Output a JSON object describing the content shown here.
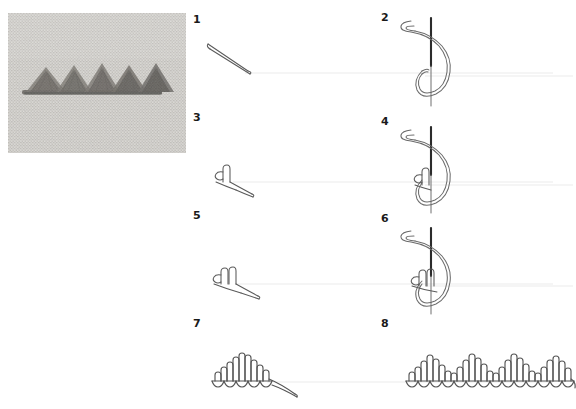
{
  "document": {
    "type": "embroidery-stitch-tutorial",
    "title": "",
    "background_color": "#ffffff",
    "step_count": 8
  },
  "photo": {
    "name": "finished-stitch-photograph",
    "description": "Photograph of linen fabric embroidered with five dark triangular peaked stitch motifs along a horizontal baseline",
    "fabric_color": "#cfcdc8",
    "thread_color": "#4a4742",
    "peak_count": 5,
    "frame": {
      "x": 8,
      "y": 13,
      "width": 178,
      "height": 140
    }
  },
  "guideline": {
    "name": "baseline-guide",
    "color": "#f2f2f2"
  },
  "ink": {
    "outline": "#5a5a5a",
    "needle": "#2b2b2b",
    "thread": "#6b6b6b"
  },
  "steps": [
    {
      "number": "1",
      "name": "step-1-first-diagonal-thread",
      "column": "left",
      "row": 1,
      "caption": "",
      "figure": "diagonal-thread-stroke"
    },
    {
      "number": "2",
      "name": "step-2-needle-wrapped-loop",
      "column": "right",
      "row": 1,
      "caption": "",
      "figure": "needle-with-thread-loop"
    },
    {
      "number": "3",
      "name": "step-3-single-knot-formed",
      "column": "left",
      "row": 2,
      "caption": "",
      "figure": "single-knot-with-tail"
    },
    {
      "number": "4",
      "name": "step-4-needle-loop-over-one-knot",
      "column": "right",
      "row": 2,
      "caption": "",
      "figure": "needle-loop-with-one-knot"
    },
    {
      "number": "5",
      "name": "step-5-two-knots-formed",
      "column": "left",
      "row": 3,
      "caption": "",
      "figure": "two-knots-with-tail"
    },
    {
      "number": "6",
      "name": "step-6-needle-loop-over-two-knots",
      "column": "right",
      "row": 3,
      "caption": "",
      "figure": "needle-loop-with-two-knots"
    },
    {
      "number": "7",
      "name": "step-7-single-completed-peak",
      "column": "left",
      "row": 4,
      "caption": "",
      "figure": "single-peak-fan"
    },
    {
      "number": "8",
      "name": "step-8-repeated-peak-row",
      "column": "right",
      "row": 4,
      "caption": "",
      "figure": "five-peak-row"
    }
  ]
}
